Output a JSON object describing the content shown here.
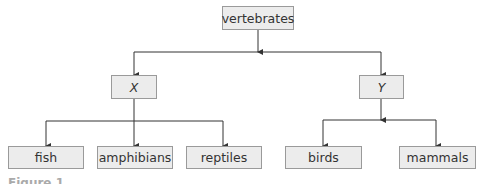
{
  "diagram": {
    "root": {
      "id": "vertebrates",
      "label": "vertebrates"
    },
    "level1": [
      {
        "id": "X",
        "label": "X",
        "italic": true
      },
      {
        "id": "Y",
        "label": "Y",
        "italic": true
      }
    ],
    "level2": [
      {
        "id": "fish",
        "label": "fish",
        "parent": "X"
      },
      {
        "id": "amphibians",
        "label": "amphibians",
        "parent": "X"
      },
      {
        "id": "reptiles",
        "label": "reptiles",
        "parent": "X"
      },
      {
        "id": "birds",
        "label": "birds",
        "parent": "Y"
      },
      {
        "id": "mammals",
        "label": "mammals",
        "parent": "Y"
      }
    ],
    "colors": {
      "box_fill": "#ececec",
      "box_border": "#9a9a9a",
      "line": "#333333"
    }
  },
  "caption": {
    "text": "Figure 1"
  }
}
